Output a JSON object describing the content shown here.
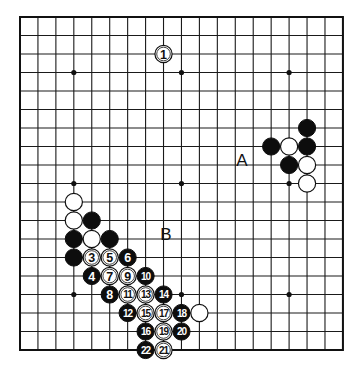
{
  "board": {
    "size": 19,
    "origin_x": 20,
    "origin_y": 17,
    "spacing_x": 17.94,
    "spacing_y": 18.5,
    "line_color": "#1a1a1a",
    "stone_radius": 8.6,
    "star_points": [
      [
        3,
        3
      ],
      [
        9,
        3
      ],
      [
        15,
        3
      ],
      [
        3,
        9
      ],
      [
        9,
        9
      ],
      [
        15,
        9
      ],
      [
        3,
        15
      ],
      [
        9,
        15
      ],
      [
        15,
        15
      ]
    ]
  },
  "stones": [
    {
      "color": "white",
      "col": 8,
      "row": 2,
      "number": "1"
    },
    {
      "color": "black",
      "col": 16,
      "row": 6,
      "number": ""
    },
    {
      "color": "black",
      "col": 14,
      "row": 7,
      "number": ""
    },
    {
      "color": "white",
      "col": 15,
      "row": 7,
      "number": ""
    },
    {
      "color": "black",
      "col": 16,
      "row": 7,
      "number": ""
    },
    {
      "color": "black",
      "col": 15,
      "row": 8,
      "number": ""
    },
    {
      "color": "white",
      "col": 16,
      "row": 8,
      "number": ""
    },
    {
      "color": "white",
      "col": 16,
      "row": 9,
      "number": ""
    },
    {
      "color": "white",
      "col": 3,
      "row": 10,
      "number": ""
    },
    {
      "color": "white",
      "col": 3,
      "row": 11,
      "number": ""
    },
    {
      "color": "black",
      "col": 4,
      "row": 11,
      "number": ""
    },
    {
      "color": "black",
      "col": 3,
      "row": 12,
      "number": ""
    },
    {
      "color": "white",
      "col": 4,
      "row": 12,
      "number": ""
    },
    {
      "color": "black",
      "col": 5,
      "row": 12,
      "number": ""
    },
    {
      "color": "black",
      "col": 3,
      "row": 13,
      "number": ""
    },
    {
      "color": "white",
      "col": 4,
      "row": 13,
      "number": "3"
    },
    {
      "color": "white",
      "col": 5,
      "row": 13,
      "number": "5"
    },
    {
      "color": "black",
      "col": 6,
      "row": 13,
      "number": "6"
    },
    {
      "color": "black",
      "col": 4,
      "row": 14,
      "number": "4"
    },
    {
      "color": "white",
      "col": 5,
      "row": 14,
      "number": "7"
    },
    {
      "color": "white",
      "col": 6,
      "row": 14,
      "number": "9"
    },
    {
      "color": "black",
      "col": 7,
      "row": 14,
      "number": "10"
    },
    {
      "color": "black",
      "col": 5,
      "row": 15,
      "number": "8"
    },
    {
      "color": "white",
      "col": 6,
      "row": 15,
      "number": "11"
    },
    {
      "color": "white",
      "col": 7,
      "row": 15,
      "number": "13"
    },
    {
      "color": "black",
      "col": 8,
      "row": 15,
      "number": "14"
    },
    {
      "color": "black",
      "col": 6,
      "row": 16,
      "number": "12"
    },
    {
      "color": "white",
      "col": 7,
      "row": 16,
      "number": "15"
    },
    {
      "color": "white",
      "col": 8,
      "row": 16,
      "number": "17"
    },
    {
      "color": "black",
      "col": 9,
      "row": 16,
      "number": "18"
    },
    {
      "color": "white",
      "col": 10,
      "row": 16,
      "number": ""
    },
    {
      "color": "black",
      "col": 7,
      "row": 17,
      "number": "16"
    },
    {
      "color": "white",
      "col": 8,
      "row": 17,
      "number": "19"
    },
    {
      "color": "black",
      "col": 9,
      "row": 17,
      "number": "20"
    },
    {
      "color": "black",
      "col": 7,
      "row": 18,
      "number": "22"
    },
    {
      "color": "white",
      "col": 8,
      "row": 18,
      "number": "21"
    }
  ],
  "labels": [
    {
      "text": "A",
      "x": 242,
      "y": 166
    },
    {
      "text": "B",
      "x": 166,
      "y": 240
    }
  ]
}
